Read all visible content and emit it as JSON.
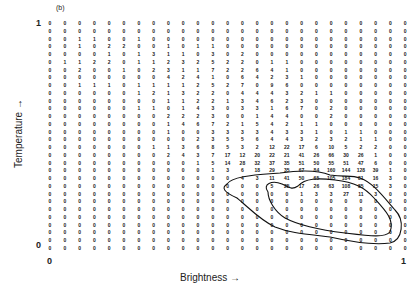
{
  "panel_label": "(b)",
  "axes": {
    "y_label": "Temperature →",
    "x_label": "Brightness →",
    "y_ticks": [
      "1",
      "0"
    ],
    "x_ticks": [
      "0",
      "1"
    ]
  },
  "chart_data": {
    "type": "heatmap",
    "title": "(b)",
    "xlabel": "Brightness",
    "ylabel": "Temperature",
    "xlim": [
      0,
      1
    ],
    "ylim": [
      0,
      1
    ],
    "n_cols": 25,
    "n_rows": 30,
    "note": "Counts per cell; rows listed top (temperature=1) to bottom (temperature=0). Two nested closed contours enclose the high-count region at lower-right.",
    "rows": [
      [
        0,
        0,
        0,
        0,
        0,
        0,
        0,
        0,
        0,
        0,
        0,
        0,
        0,
        0,
        0,
        0,
        0,
        0,
        0,
        0,
        0,
        0,
        0,
        0,
        0
      ],
      [
        0,
        0,
        0,
        0,
        0,
        0,
        0,
        0,
        0,
        0,
        0,
        0,
        0,
        0,
        0,
        0,
        0,
        0,
        0,
        0,
        0,
        0,
        0,
        0,
        0
      ],
      [
        0,
        0,
        1,
        1,
        0,
        0,
        1,
        0,
        0,
        0,
        0,
        0,
        0,
        0,
        0,
        0,
        0,
        0,
        0,
        0,
        0,
        0,
        0,
        0,
        0
      ],
      [
        0,
        0,
        1,
        0,
        2,
        2,
        0,
        0,
        1,
        0,
        1,
        1,
        0,
        0,
        0,
        0,
        0,
        0,
        0,
        0,
        0,
        0,
        0,
        0,
        0
      ],
      [
        0,
        0,
        0,
        0,
        1,
        0,
        1,
        3,
        1,
        1,
        0,
        3,
        0,
        2,
        0,
        0,
        0,
        0,
        0,
        0,
        0,
        0,
        0,
        0,
        0
      ],
      [
        0,
        1,
        1,
        2,
        2,
        0,
        1,
        1,
        2,
        3,
        2,
        5,
        2,
        2,
        0,
        1,
        1,
        0,
        0,
        0,
        0,
        0,
        0,
        0,
        0
      ],
      [
        0,
        0,
        2,
        0,
        0,
        1,
        0,
        2,
        3,
        1,
        1,
        7,
        2,
        2,
        6,
        4,
        1,
        0,
        0,
        0,
        0,
        0,
        0,
        0,
        0
      ],
      [
        0,
        0,
        0,
        0,
        0,
        0,
        0,
        0,
        4,
        2,
        4,
        1,
        0,
        6,
        4,
        2,
        3,
        1,
        0,
        0,
        0,
        0,
        0,
        0,
        0
      ],
      [
        0,
        0,
        1,
        1,
        1,
        0,
        1,
        1,
        1,
        1,
        2,
        5,
        2,
        7,
        0,
        9,
        6,
        0,
        0,
        0,
        0,
        0,
        0,
        0,
        0
      ],
      [
        0,
        0,
        0,
        0,
        0,
        0,
        1,
        2,
        1,
        3,
        2,
        2,
        0,
        4,
        4,
        4,
        3,
        2,
        1,
        1,
        0,
        0,
        0,
        0,
        0
      ],
      [
        0,
        0,
        0,
        0,
        0,
        0,
        0,
        0,
        1,
        1,
        2,
        2,
        1,
        3,
        4,
        6,
        2,
        3,
        0,
        0,
        0,
        0,
        0,
        0,
        0
      ],
      [
        0,
        0,
        0,
        0,
        0,
        0,
        1,
        1,
        0,
        1,
        4,
        3,
        0,
        3,
        3,
        1,
        6,
        7,
        0,
        2,
        0,
        0,
        0,
        0,
        0
      ],
      [
        0,
        0,
        0,
        0,
        0,
        0,
        0,
        0,
        2,
        2,
        2,
        3,
        0,
        0,
        1,
        4,
        4,
        0,
        0,
        2,
        0,
        0,
        0,
        0,
        0
      ],
      [
        0,
        0,
        0,
        0,
        0,
        0,
        0,
        0,
        1,
        4,
        6,
        7,
        2,
        1,
        5,
        4,
        2,
        1,
        1,
        0,
        0,
        0,
        0,
        0,
        0
      ],
      [
        0,
        0,
        0,
        0,
        0,
        0,
        0,
        0,
        1,
        0,
        0,
        3,
        3,
        3,
        3,
        4,
        3,
        3,
        1,
        0,
        1,
        1,
        0,
        0,
        0
      ],
      [
        0,
        0,
        0,
        0,
        0,
        0,
        0,
        0,
        0,
        0,
        2,
        3,
        5,
        5,
        6,
        4,
        4,
        3,
        2,
        3,
        2,
        1,
        1,
        0,
        0
      ],
      [
        0,
        0,
        0,
        0,
        0,
        0,
        0,
        1,
        1,
        3,
        6,
        8,
        5,
        3,
        2,
        12,
        22,
        17,
        6,
        10,
        5,
        2,
        2,
        0,
        0
      ],
      [
        0,
        0,
        0,
        0,
        0,
        0,
        0,
        0,
        2,
        4,
        3,
        7,
        17,
        12,
        20,
        22,
        21,
        41,
        26,
        66,
        30,
        26,
        1,
        0,
        0
      ],
      [
        0,
        0,
        0,
        0,
        0,
        0,
        0,
        0,
        0,
        0,
        1,
        5,
        14,
        28,
        32,
        37,
        35,
        51,
        50,
        55,
        51,
        47,
        6,
        0,
        0
      ],
      [
        0,
        0,
        0,
        0,
        0,
        0,
        0,
        0,
        0,
        0,
        0,
        1,
        3,
        6,
        18,
        29,
        35,
        67,
        84,
        160,
        144,
        128,
        39,
        1,
        0
      ],
      [
        0,
        0,
        0,
        0,
        0,
        0,
        0,
        0,
        0,
        0,
        0,
        0,
        0,
        4,
        3,
        11,
        41,
        50,
        65,
        105,
        184,
        81,
        16,
        3,
        0
      ],
      [
        0,
        0,
        0,
        0,
        0,
        0,
        0,
        0,
        0,
        0,
        0,
        0,
        0,
        0,
        0,
        5,
        25,
        17,
        26,
        63,
        108,
        85,
        15,
        3,
        0
      ],
      [
        0,
        0,
        0,
        0,
        0,
        0,
        0,
        0,
        0,
        0,
        0,
        0,
        0,
        0,
        0,
        0,
        0,
        1,
        3,
        3,
        27,
        11,
        3,
        0,
        0
      ],
      [
        0,
        0,
        0,
        0,
        0,
        0,
        0,
        0,
        0,
        0,
        0,
        0,
        0,
        0,
        0,
        0,
        0,
        0,
        0,
        0,
        0,
        0,
        0,
        0,
        0
      ],
      [
        0,
        0,
        0,
        0,
        0,
        0,
        0,
        0,
        0,
        0,
        0,
        0,
        0,
        0,
        0,
        0,
        0,
        0,
        0,
        0,
        0,
        0,
        0,
        0,
        0
      ],
      [
        0,
        0,
        0,
        0,
        0,
        0,
        0,
        0,
        0,
        0,
        0,
        0,
        0,
        0,
        0,
        0,
        0,
        0,
        0,
        0,
        0,
        0,
        0,
        0,
        0
      ],
      [
        0,
        0,
        0,
        0,
        0,
        0,
        0,
        0,
        0,
        0,
        0,
        0,
        0,
        0,
        0,
        0,
        0,
        0,
        0,
        0,
        0,
        0,
        0,
        0,
        0
      ],
      [
        0,
        0,
        0,
        0,
        0,
        0,
        0,
        0,
        0,
        0,
        0,
        0,
        0,
        0,
        0,
        0,
        0,
        0,
        0,
        0,
        0,
        0,
        0,
        0,
        0
      ],
      [
        0,
        0,
        0,
        0,
        0,
        0,
        0,
        0,
        0,
        0,
        0,
        0,
        0,
        0,
        0,
        0,
        0,
        0,
        0,
        0,
        0,
        0,
        0,
        0,
        0
      ],
      [
        0,
        0,
        0,
        0,
        0,
        0,
        0,
        0,
        0,
        0,
        0,
        0,
        0,
        0,
        0,
        0,
        0,
        0,
        0,
        0,
        0,
        0,
        0,
        0,
        0
      ]
    ],
    "contours": [
      {
        "name": "outer",
        "closed": true
      },
      {
        "name": "inner",
        "closed": true
      }
    ],
    "grid": false,
    "legend": "none"
  }
}
